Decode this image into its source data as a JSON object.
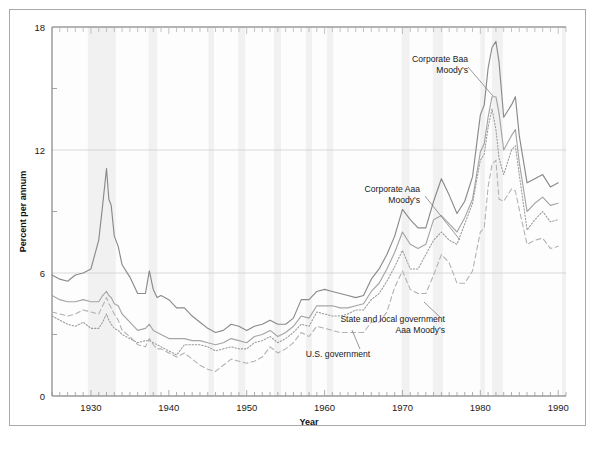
{
  "figure": {
    "outer_frame": true,
    "background": "#ffffff",
    "border_color": "#a8a8a8"
  },
  "axes": {
    "y_title": "Percent per annum",
    "x_title": "Year",
    "y_ticks": [
      0,
      6,
      12,
      18
    ],
    "x_ticks": [
      1930,
      1940,
      1950,
      1960,
      1970,
      1980,
      1990
    ],
    "x_tick_labels": [
      "1930",
      "1940",
      "1950",
      "1960",
      "1970",
      "1980",
      "1990"
    ],
    "y_tick_labels": [
      "0",
      "6",
      "12",
      "18"
    ]
  },
  "annotations": [
    {
      "id": "corporate-baa",
      "text_line1": "Corporate Baa",
      "text_line2": "Moody's",
      "x": 468,
      "y": 62
    },
    {
      "id": "corporate-aaa",
      "text_line1": "Corporate Aaa",
      "text_line2": "Moody's",
      "x": 420,
      "y": 192
    },
    {
      "id": "state-local",
      "text_line1": "State and local government",
      "text_line2": "Aaa Moody's",
      "x": 445,
      "y": 322
    },
    {
      "id": "us-government",
      "text_line1": "U.S. government",
      "text_line2": "",
      "x": 338,
      "y": 357
    }
  ],
  "chart_data": {
    "type": "line",
    "title": "",
    "xlabel": "Year",
    "ylabel": "Percent per annum",
    "xlim": [
      1925,
      1991
    ],
    "ylim": [
      0,
      18
    ],
    "grid": "horizontal-major",
    "legend": "inline-annotations",
    "colors": {
      "corporate_baa": "#8a8a8a",
      "corporate_aaa": "#a5a5a5",
      "us_government": "#9a9a9a",
      "state_local": "#b0b0b0",
      "gridline": "#cfcfcf",
      "recession_band": "#f1f1f1"
    },
    "recession_bands": [
      [
        1929.6,
        1933.2
      ],
      [
        1937.4,
        1938.5
      ],
      [
        1945.1,
        1945.8
      ],
      [
        1948.9,
        1949.8
      ],
      [
        1953.5,
        1954.4
      ],
      [
        1957.6,
        1958.4
      ],
      [
        1960.3,
        1961.1
      ],
      [
        1969.9,
        1970.9
      ],
      [
        1973.9,
        1975.2
      ],
      [
        1980.0,
        1980.6
      ],
      [
        1981.5,
        1982.9
      ],
      [
        1990.5,
        1991.0
      ]
    ],
    "x": [
      1925,
      1926,
      1927,
      1928,
      1929,
      1930,
      1931,
      1931.5,
      1932,
      1932.3,
      1932.6,
      1933,
      1933.5,
      1934,
      1935,
      1936,
      1937,
      1937.5,
      1938,
      1938.5,
      1939,
      1940,
      1941,
      1942,
      1943,
      1944,
      1945,
      1946,
      1947,
      1948,
      1949,
      1950,
      1951,
      1952,
      1953,
      1954,
      1955,
      1956,
      1957,
      1958,
      1959,
      1960,
      1961,
      1962,
      1963,
      1964,
      1965,
      1966,
      1967,
      1968,
      1969,
      1970,
      1971,
      1972,
      1973,
      1974,
      1975,
      1976,
      1977,
      1978,
      1979,
      1980,
      1980.5,
      1981,
      1981.5,
      1982,
      1982.4,
      1983,
      1984,
      1984.5,
      1985,
      1986,
      1987,
      1988,
      1989,
      1990
    ],
    "series": [
      {
        "name": "Corporate Baa Moody's",
        "style": "solid",
        "color": "#8a8a8a",
        "values": [
          5.9,
          5.7,
          5.6,
          5.9,
          6.0,
          6.2,
          7.6,
          9.3,
          11.1,
          9.6,
          9.3,
          7.8,
          7.3,
          6.4,
          5.8,
          5.0,
          5.0,
          6.1,
          5.2,
          4.8,
          4.9,
          4.7,
          4.3,
          4.3,
          3.9,
          3.6,
          3.3,
          3.1,
          3.2,
          3.5,
          3.4,
          3.2,
          3.4,
          3.5,
          3.7,
          3.5,
          3.5,
          3.8,
          4.7,
          4.7,
          5.1,
          5.2,
          5.1,
          5.0,
          4.9,
          4.8,
          4.9,
          5.7,
          6.2,
          6.9,
          7.8,
          9.1,
          8.6,
          8.2,
          8.2,
          9.5,
          10.6,
          9.8,
          8.9,
          9.5,
          10.7,
          13.7,
          14.2,
          16.0,
          17.0,
          17.3,
          16.3,
          13.6,
          14.2,
          14.6,
          12.7,
          10.4,
          10.6,
          10.8,
          10.2,
          10.4
        ]
      },
      {
        "name": "Corporate Aaa Moody's",
        "style": "solid",
        "color": "#a5a5a5",
        "values": [
          4.9,
          4.7,
          4.6,
          4.6,
          4.7,
          4.6,
          4.6,
          4.9,
          5.1,
          4.9,
          4.8,
          4.5,
          4.4,
          4.0,
          3.6,
          3.2,
          3.3,
          3.5,
          3.2,
          3.1,
          3.0,
          2.8,
          2.8,
          2.8,
          2.7,
          2.7,
          2.6,
          2.5,
          2.6,
          2.8,
          2.7,
          2.6,
          2.9,
          3.0,
          3.2,
          2.9,
          3.1,
          3.4,
          3.9,
          3.8,
          4.4,
          4.4,
          4.4,
          4.3,
          4.3,
          4.4,
          4.5,
          5.1,
          5.5,
          6.2,
          7.0,
          8.0,
          7.4,
          7.2,
          7.4,
          8.6,
          8.8,
          8.4,
          8.0,
          8.7,
          9.6,
          11.9,
          12.3,
          13.6,
          14.6,
          14.6,
          13.8,
          12.0,
          12.7,
          13.0,
          11.4,
          9.0,
          9.4,
          9.7,
          9.3,
          9.4
        ]
      },
      {
        "name": "U.S. government",
        "style": "dotted",
        "color": "#9a9a9a",
        "values": [
          3.9,
          3.7,
          3.5,
          3.4,
          3.6,
          3.3,
          3.3,
          3.6,
          4.0,
          3.7,
          3.5,
          3.3,
          3.2,
          3.0,
          2.8,
          2.6,
          2.7,
          2.7,
          2.6,
          2.5,
          2.4,
          2.2,
          2.0,
          2.5,
          2.5,
          2.5,
          2.4,
          2.2,
          2.3,
          2.4,
          2.3,
          2.3,
          2.6,
          2.7,
          2.9,
          2.6,
          2.8,
          3.1,
          3.5,
          3.4,
          4.1,
          4.0,
          3.9,
          3.9,
          4.0,
          4.2,
          4.2,
          4.7,
          5.0,
          5.6,
          6.3,
          7.1,
          6.2,
          6.2,
          6.9,
          7.6,
          8.0,
          7.6,
          7.4,
          8.4,
          9.4,
          11.5,
          11.8,
          13.1,
          14.0,
          13.0,
          11.6,
          10.8,
          12.0,
          12.2,
          10.8,
          8.1,
          8.6,
          9.0,
          8.5,
          8.6
        ]
      },
      {
        "name": "State and local government Aaa Moody's",
        "style": "dashed",
        "color": "#b0b0b0",
        "values": [
          4.1,
          4.0,
          3.9,
          4.0,
          4.2,
          4.1,
          4.0,
          4.4,
          4.8,
          4.5,
          4.3,
          4.0,
          3.7,
          3.2,
          2.9,
          2.5,
          2.4,
          2.8,
          2.5,
          2.3,
          2.3,
          2.1,
          1.9,
          2.1,
          1.8,
          1.5,
          1.3,
          1.2,
          1.5,
          1.8,
          1.7,
          1.6,
          1.7,
          1.9,
          2.4,
          2.1,
          2.3,
          2.6,
          3.1,
          2.9,
          3.4,
          3.3,
          3.2,
          3.1,
          3.1,
          3.1,
          3.1,
          3.6,
          3.6,
          4.1,
          5.3,
          6.1,
          5.2,
          5.0,
          5.0,
          5.9,
          6.9,
          6.5,
          5.5,
          5.5,
          6.1,
          8.0,
          8.2,
          10.2,
          11.3,
          11.5,
          9.6,
          9.5,
          10.1,
          10.0,
          9.1,
          7.4,
          7.6,
          7.7,
          7.2,
          7.3
        ]
      }
    ]
  }
}
